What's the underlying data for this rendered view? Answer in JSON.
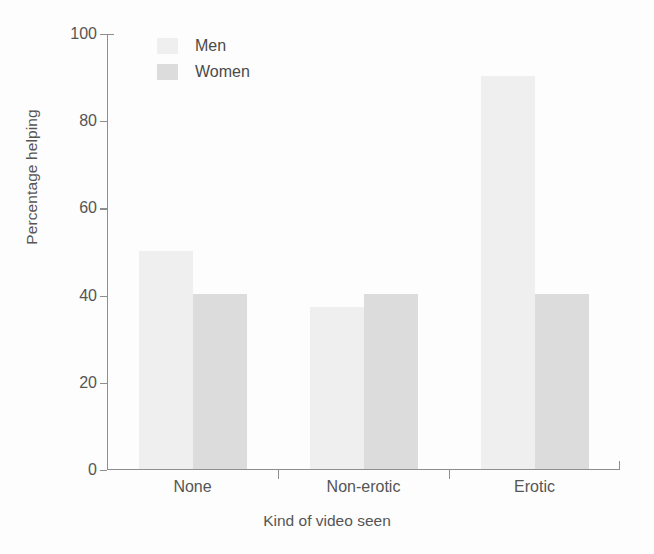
{
  "chart_data": {
    "type": "bar",
    "title": "",
    "xlabel": "Kind of video seen",
    "ylabel": "Percentage helping",
    "categories": [
      "None",
      "Non-erotic",
      "Erotic"
    ],
    "series": [
      {
        "name": "Men",
        "values": [
          50,
          37,
          90
        ],
        "color": "#efefef"
      },
      {
        "name": "Women",
        "values": [
          40,
          40,
          40
        ],
        "color": "#dcdcdc"
      }
    ],
    "ylim": [
      0,
      100
    ],
    "yticks": [
      0,
      20,
      40,
      60,
      80,
      100
    ],
    "ytick_labels": [
      "0",
      "20",
      "40",
      "60",
      "80",
      "100"
    ],
    "grid": false,
    "legend_position": "top-left-inside",
    "axis_color": "#8e8e8e",
    "text_color": "#555555",
    "background": "#fdfdfd"
  },
  "legend": {
    "entries": [
      {
        "label": "Men",
        "swatch": "men"
      },
      {
        "label": "Women",
        "swatch": "women"
      }
    ]
  },
  "axes": {
    "y_title": "Percentage helping",
    "x_title": "Kind of video seen",
    "y_labels": [
      "100",
      "80",
      "60",
      "40",
      "20",
      "0"
    ],
    "x_labels": [
      "None",
      "Non-erotic",
      "Erotic"
    ]
  }
}
